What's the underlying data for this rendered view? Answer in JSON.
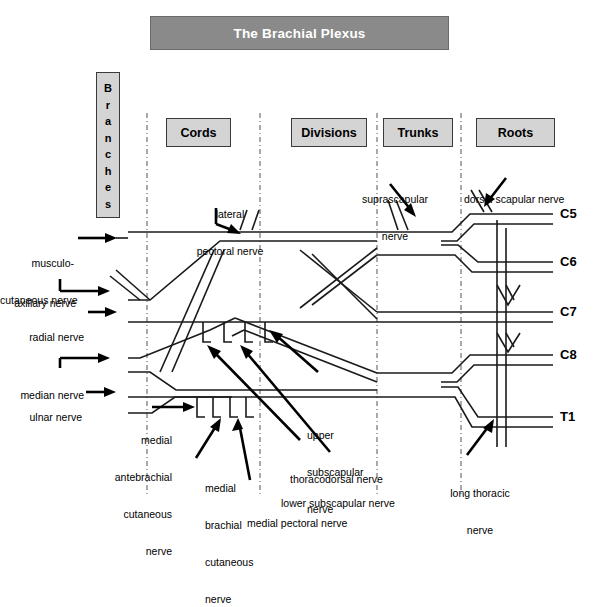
{
  "title": {
    "text": "The Brachial Plexus"
  },
  "columns": [
    {
      "key": "cords",
      "label": "Cords"
    },
    {
      "key": "divisions",
      "label": "Divisions"
    },
    {
      "key": "trunks",
      "label": "Trunks"
    },
    {
      "key": "roots",
      "label": "Roots"
    }
  ],
  "branches_column": {
    "label": "Branches",
    "letters": [
      "B",
      "r",
      "a",
      "n",
      "c",
      "h",
      "e",
      "s"
    ]
  },
  "roots": [
    {
      "label": "C5"
    },
    {
      "label": "C6"
    },
    {
      "label": "C7"
    },
    {
      "label": "C8"
    },
    {
      "label": "T1"
    }
  ],
  "left_labels": [
    {
      "key": "musculocutaneous",
      "lines": [
        "musculo-",
        "cutaneous nerve"
      ]
    },
    {
      "key": "axillary",
      "lines": [
        "axillary nerve"
      ]
    },
    {
      "key": "radial",
      "lines": [
        "radial nerve"
      ]
    },
    {
      "key": "median",
      "lines": [
        "median nerve"
      ]
    },
    {
      "key": "ulnar",
      "lines": [
        "ulnar nerve"
      ]
    }
  ],
  "annotations": [
    {
      "key": "lateral-pectoral-nerve",
      "lines": [
        "lateral",
        "pectoral nerve"
      ]
    },
    {
      "key": "suprascapular-nerve",
      "lines": [
        "suprascapular",
        "nerve"
      ]
    },
    {
      "key": "dorsal-scapular-nerve",
      "lines": [
        "dorsal scapular nerve"
      ]
    },
    {
      "key": "medial-antebrachial-cutaneous-nerve",
      "lines": [
        "medial",
        "antebrachial",
        "cutaneous",
        "nerve"
      ]
    },
    {
      "key": "medial-brachial-cutaneous-nerve",
      "lines": [
        "medial",
        "brachial",
        "cutaneous",
        "nerve"
      ]
    },
    {
      "key": "medial-pectoral-nerve",
      "lines": [
        "medial pectoral nerve"
      ]
    },
    {
      "key": "upper-subscapular-nerve",
      "lines": [
        "upper",
        "subscapular",
        "nerve"
      ]
    },
    {
      "key": "thoracodorsal-nerve",
      "lines": [
        "thoracodorsal nerve"
      ]
    },
    {
      "key": "lower-subscapular-nerve",
      "lines": [
        "lower subscapular nerve"
      ]
    },
    {
      "key": "long-thoracic-nerve",
      "lines": [
        "long thoracic",
        "nerve"
      ]
    }
  ],
  "colors": {
    "title_bg": "#8a8a8a",
    "title_fg": "#ffffff",
    "box_bg": "#d4d4d4",
    "box_border": "#3a3a3a",
    "nerve_stroke": "#1a1a1a",
    "divider": "#555555",
    "page_bg": "#ffffff"
  }
}
